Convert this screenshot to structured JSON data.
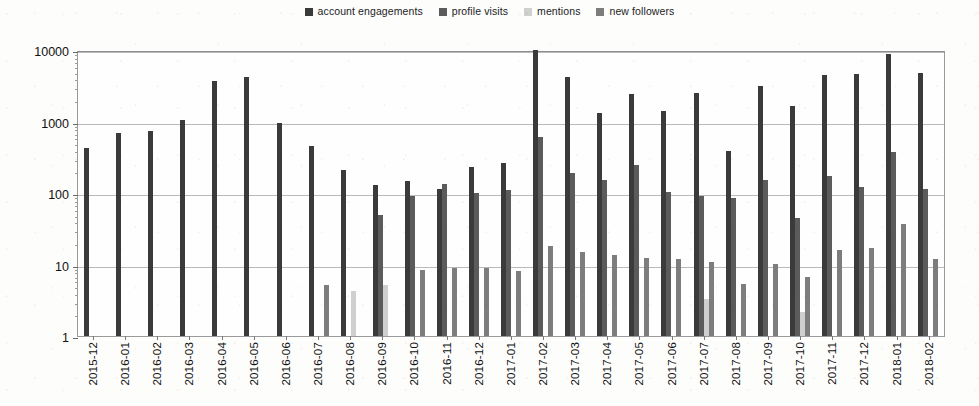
{
  "chart_data": {
    "type": "bar",
    "title": "",
    "xlabel": "",
    "ylabel": "",
    "yscale": "log",
    "ylim": [
      1,
      10000
    ],
    "yticks": [
      1,
      10,
      100,
      1000,
      10000
    ],
    "ytick_labels": [
      "1",
      "10",
      "100",
      "1000",
      "10000"
    ],
    "grid": true,
    "legend_position": "top-center",
    "categories": [
      "2015-12",
      "2016-01",
      "2016-02",
      "2016-03",
      "2016-04",
      "2016-05",
      "2016-06",
      "2016-07",
      "2016-08",
      "2016-09",
      "2016-10",
      "2016-11",
      "2016-12",
      "2017-01",
      "2017-02",
      "2017-03",
      "2017-04",
      "2017-05",
      "2017-06",
      "2017-07",
      "2017-08",
      "2017-09",
      "2017-10",
      "2017-11",
      "2017-12",
      "2018-01",
      "2018-02"
    ],
    "series": [
      {
        "name": "account engagements",
        "color": "#3a3a3a",
        "values": [
          430,
          680,
          740,
          1050,
          3700,
          4200,
          950,
          450,
          210,
          130,
          145,
          115,
          230,
          265,
          10000,
          4200,
          1300,
          2400,
          1400,
          2500,
          390,
          3100,
          1650,
          4500,
          4600,
          8800,
          4800
        ]
      },
      {
        "name": "profile visits",
        "color": "#5b5b5b",
        "values": [
          null,
          null,
          null,
          null,
          null,
          null,
          null,
          null,
          null,
          50,
          90,
          135,
          100,
          110,
          600,
          190,
          150,
          250,
          105,
          90,
          86,
          150,
          45,
          175,
          120,
          370,
          115
        ]
      },
      {
        "name": "mentions",
        "color": "#cfcfcf",
        "values": [
          null,
          null,
          null,
          null,
          null,
          null,
          null,
          null,
          4.2,
          5.1,
          null,
          null,
          null,
          null,
          null,
          null,
          null,
          null,
          null,
          3.3,
          null,
          null,
          2.2,
          null,
          null,
          null,
          null
        ]
      },
      {
        "name": "new followers",
        "color": "#7d7d7d",
        "values": [
          null,
          null,
          null,
          null,
          null,
          null,
          null,
          5.2,
          null,
          null,
          8.4,
          9.0,
          8.8,
          8.2,
          18,
          15,
          13.5,
          12.5,
          12,
          11,
          5.3,
          10.2,
          6.6,
          16,
          17,
          37,
          12
        ]
      }
    ]
  },
  "legend": {
    "items": [
      {
        "label": "account engagements",
        "color": "#3a3a3a"
      },
      {
        "label": "profile visits",
        "color": "#5b5b5b"
      },
      {
        "label": "mentions",
        "color": "#cfcfcf"
      },
      {
        "label": "new followers",
        "color": "#7d7d7d"
      }
    ]
  }
}
